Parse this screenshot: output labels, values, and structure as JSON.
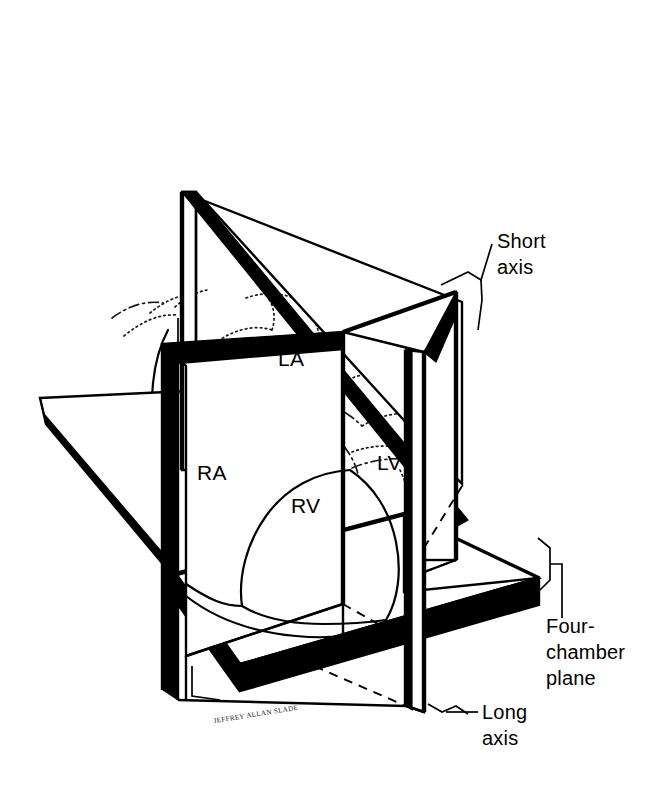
{
  "figure": {
    "background_color": "#ffffff",
    "ink_color": "#000000",
    "width": 649,
    "height": 788
  },
  "chamber_labels": [
    {
      "id": "la",
      "text": "LA",
      "name": "left atrium",
      "x": 278,
      "y": 366
    },
    {
      "id": "ra",
      "text": "RA",
      "name": "right atrium",
      "x": 197,
      "y": 480
    },
    {
      "id": "lv",
      "text": "LV",
      "name": "left ventricle",
      "x": 377,
      "y": 470
    },
    {
      "id": "rv",
      "text": "RV",
      "name": "right ventricle",
      "x": 291,
      "y": 513
    }
  ],
  "annotations": [
    {
      "id": "short-axis",
      "lines": [
        "Short",
        "axis"
      ],
      "x": 497,
      "y": 248
    },
    {
      "id": "four-chamber",
      "lines": [
        "Four-",
        "chamber",
        "plane"
      ],
      "x": 546,
      "y": 633
    },
    {
      "id": "long-axis",
      "lines": [
        "Long",
        "axis"
      ],
      "x": 482,
      "y": 719
    }
  ],
  "artist_signature": {
    "text": "JEFFREY ALLAN SLADE",
    "x": 216,
    "y": 722
  },
  "planes": [
    {
      "id": "short-axis-plane",
      "label": "Short axis",
      "orientation": "oblique-vertical"
    },
    {
      "id": "four-chamber-plane",
      "label": "Four-chamber plane",
      "orientation": "horizontal"
    },
    {
      "id": "long-axis-plane",
      "label": "Long axis",
      "orientation": "frontal-vertical"
    }
  ]
}
